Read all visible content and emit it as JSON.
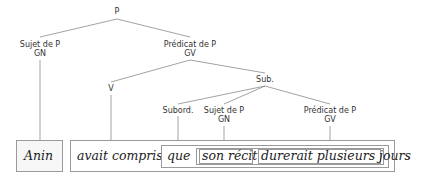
{
  "diagram": {
    "root": {
      "label": "P"
    },
    "subject": {
      "line1": "Sujet de P",
      "line2": "GN"
    },
    "predicate": {
      "line1": "Prédicat de P",
      "line2": "GV"
    },
    "verb": {
      "label": "V"
    },
    "sub": {
      "label": "Sub."
    },
    "subord": {
      "label": "Subord."
    },
    "sub_subject": {
      "line1": "Sujet de P",
      "line2": "GN"
    },
    "sub_predicate": {
      "line1": "Prédicat de P",
      "line2": "GV"
    }
  },
  "sentence": {
    "w1": "Anin",
    "w2": "avait compris",
    "w3": "que",
    "w4": "son récit",
    "w5": "durerait plusieurs jours",
    "punct": "."
  },
  "colors": {
    "line": "#8a8a8a",
    "box_border": "#9a9a9a",
    "text": "#222222"
  }
}
